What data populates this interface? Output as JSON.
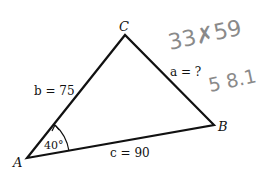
{
  "diagram": {
    "type": "triangle",
    "vertices": {
      "A": {
        "label": "A",
        "x": 27,
        "y": 158
      },
      "B": {
        "label": "B",
        "x": 214,
        "y": 125
      },
      "C": {
        "label": "C",
        "x": 125,
        "y": 35
      }
    },
    "sides": {
      "a": {
        "label": "a = ?"
      },
      "b": {
        "label": "b = 75"
      },
      "c": {
        "label": "c = 90"
      }
    },
    "angle_A": {
      "label": "40°"
    },
    "handwritten": {
      "note1": "33.59",
      "note1_display": "33✗59",
      "note2": "58.1",
      "note2_display": "5 8.1"
    },
    "colors": {
      "line": "#111111",
      "handwriting": "#8a8a8a"
    }
  }
}
